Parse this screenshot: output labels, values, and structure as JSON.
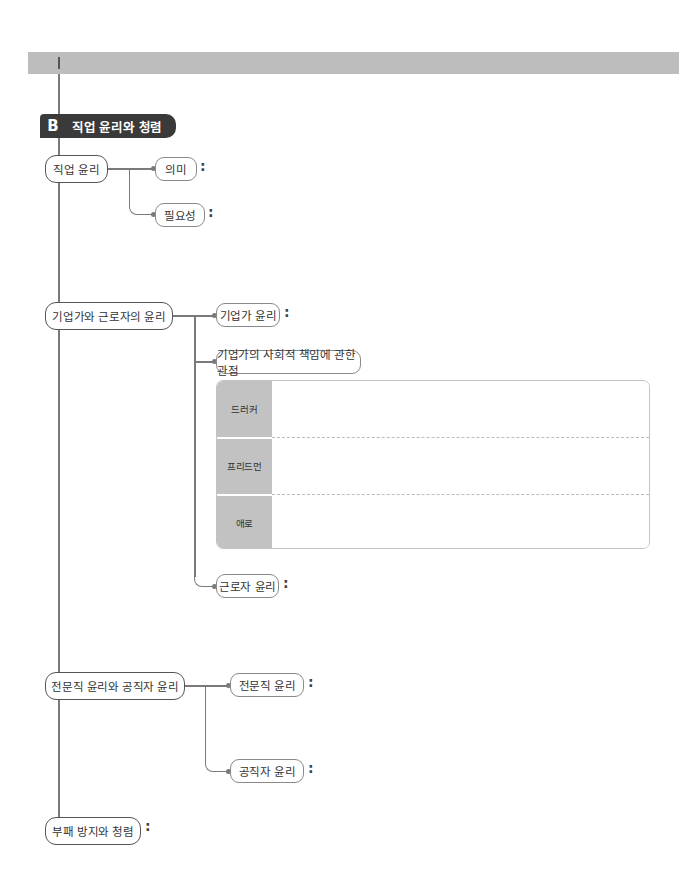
{
  "section": {
    "letter": "B",
    "title": "직업 윤리와 청렴"
  },
  "colon": ":",
  "nodes": {
    "job_ethics": {
      "label": "직업 윤리",
      "children": {
        "meaning": "의미",
        "necessity": "필요성"
      }
    },
    "entrepreneur_worker": {
      "label": "기업가와 근로자의 윤리",
      "children": {
        "entrepreneur_ethics": "기업가 윤리",
        "csr_views": "기업가의 사회적 책임에 관한 관점",
        "worker_ethics": "근로자 윤리"
      },
      "views_table": [
        {
          "label": "드러커",
          "content": ""
        },
        {
          "label": "프리드먼",
          "content": ""
        },
        {
          "label": "애로",
          "content": ""
        }
      ]
    },
    "professional_public": {
      "label": "전문직 윤리와 공직자 윤리",
      "children": {
        "professional_ethics": "전문직 윤리",
        "public_official_ethics": "공직자 윤리"
      }
    },
    "anti_corruption": {
      "label": "부패 방지와 청렴"
    }
  },
  "colors": {
    "band": "#bdbdbd",
    "badge": "#3a3a3a",
    "table_label": "#c2c2c2",
    "line": "#7a7a7a"
  }
}
